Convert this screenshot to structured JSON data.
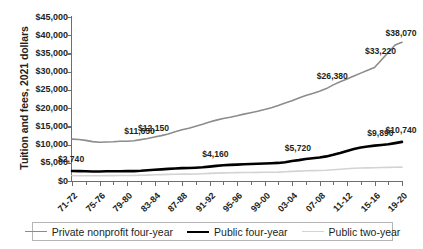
{
  "chart_data": {
    "type": "line",
    "title": "",
    "xlabel": "",
    "ylabel": "Tuition and fees, 2021 dollars",
    "ylim": [
      0,
      45000
    ],
    "ytick_labels": [
      "$45,000",
      "$40,000",
      "$35,000",
      "$30,000",
      "$25,000",
      "$20,000",
      "$15,000",
      "$10,000",
      "$5,000",
      "$0"
    ],
    "ytick_values": [
      45000,
      40000,
      35000,
      30000,
      25000,
      20000,
      15000,
      10000,
      5000,
      0
    ],
    "grid": false,
    "legend_position": "bottom",
    "categories": [
      "71-72",
      "72-73",
      "73-74",
      "74-75",
      "75-76",
      "76-77",
      "77-78",
      "78-79",
      "79-80",
      "80-81",
      "81-82",
      "82-83",
      "83-84",
      "84-85",
      "85-86",
      "86-87",
      "87-88",
      "88-89",
      "89-90",
      "90-91",
      "91-92",
      "92-93",
      "93-94",
      "94-95",
      "95-96",
      "96-97",
      "97-98",
      "98-99",
      "99-00",
      "00-01",
      "01-02",
      "02-03",
      "03-04",
      "04-05",
      "05-06",
      "06-07",
      "07-08",
      "08-09",
      "09-10",
      "10-11",
      "11-12",
      "12-13",
      "13-14",
      "14-15",
      "15-16",
      "16-17",
      "17-18",
      "18-19",
      "19-20"
    ],
    "xtick_labels": [
      "71-72",
      "75-76",
      "79-80",
      "83-84",
      "87-88",
      "91-92",
      "95-96",
      "99-00",
      "03-04",
      "07-08",
      "11-12",
      "15-16",
      "19-20"
    ],
    "series": [
      {
        "name": "Private nonprofit four-year",
        "color": "#8c8c8c",
        "width": 1.6,
        "values": [
          11500,
          11400,
          11150,
          10800,
          10650,
          10700,
          10750,
          10900,
          10900,
          11050,
          11350,
          11650,
          12050,
          12450,
          12900,
          13500,
          14050,
          14500,
          15050,
          15600,
          16200,
          16700,
          17150,
          17500,
          17900,
          18350,
          18750,
          19150,
          19600,
          20100,
          20700,
          21400,
          22000,
          22800,
          23450,
          24000,
          24650,
          25350,
          26380,
          27250,
          28000,
          28800,
          29600,
          30400,
          31150,
          33220,
          35300,
          37300,
          38070
        ]
      },
      {
        "name": "Public four-year",
        "color": "#000000",
        "width": 2.6,
        "values": [
          2740,
          2720,
          2660,
          2610,
          2620,
          2670,
          2680,
          2690,
          2700,
          2720,
          2800,
          2950,
          3080,
          3200,
          3320,
          3450,
          3520,
          3580,
          3650,
          3760,
          3950,
          4160,
          4310,
          4420,
          4500,
          4580,
          4660,
          4740,
          4820,
          4880,
          4960,
          5150,
          5500,
          5720,
          6050,
          6250,
          6450,
          6750,
          7200,
          7700,
          8250,
          8800,
          9200,
          9450,
          9700,
          9890,
          10100,
          10400,
          10740
        ]
      },
      {
        "name": "Public two-year",
        "color": "#d3d3d3",
        "width": 1.6,
        "values": [
          1480,
          1460,
          1440,
          1420,
          1440,
          1470,
          1480,
          1490,
          1500,
          1520,
          1560,
          1620,
          1700,
          1760,
          1810,
          1860,
          1880,
          1900,
          1930,
          1990,
          2080,
          2160,
          2230,
          2260,
          2290,
          2320,
          2350,
          2380,
          2400,
          2420,
          2440,
          2520,
          2640,
          2720,
          2800,
          2840,
          2880,
          2950,
          3080,
          3230,
          3380,
          3480,
          3550,
          3600,
          3650,
          3700,
          3740,
          3780,
          3800
        ]
      }
    ],
    "annotations": [
      {
        "label": "$11,650",
        "series": "Private nonprofit four-year",
        "category": "81-82"
      },
      {
        "label": "$12,150",
        "series": "Private nonprofit four-year",
        "category": "83-84"
      },
      {
        "label": "$26,380",
        "series": "Private nonprofit four-year",
        "category": "09-10"
      },
      {
        "label": "$33,220",
        "series": "Private nonprofit four-year",
        "category": "16-17"
      },
      {
        "label": "$38,070",
        "series": "Private nonprofit four-year",
        "category": "19-20"
      },
      {
        "label": "$2,740",
        "series": "Public four-year",
        "category": "71-72"
      },
      {
        "label": "$4,160",
        "series": "Public four-year",
        "category": "92-93"
      },
      {
        "label": "$5,720",
        "series": "Public four-year",
        "category": "04-05"
      },
      {
        "label": "$9,890",
        "series": "Public four-year",
        "category": "16-17"
      },
      {
        "label": "$10,740",
        "series": "Public four-year",
        "category": "19-20"
      }
    ]
  },
  "legend": {
    "items": [
      {
        "label": "Private nonprofit four-year"
      },
      {
        "label": "Public four-year"
      },
      {
        "label": "Public two-year"
      }
    ]
  }
}
